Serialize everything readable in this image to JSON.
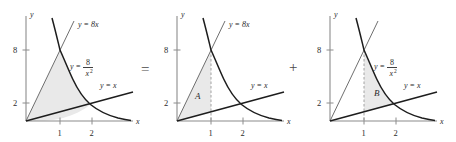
{
  "figure": {
    "caption": "",
    "operators": {
      "equals": "=",
      "plus": "+"
    },
    "shade_color": "#e9e9e9",
    "curve_color": "#1d1d1d",
    "axis_color": "#8c8c8c",
    "thin_line_color": "#6f6f6f"
  },
  "panels": [
    {
      "id": "panel-1",
      "axis": {
        "x_label": "x",
        "y_label": "y",
        "x_ticks": [
          {
            "value": 1,
            "label": "1"
          },
          {
            "value": 2,
            "label": "2"
          }
        ],
        "y_ticks": [
          {
            "value": 2,
            "label": "2"
          },
          {
            "value": 8,
            "label": "8"
          }
        ]
      },
      "curves": [
        {
          "name": "line-y-eq-8x",
          "label": "y = 8x"
        },
        {
          "name": "curve-y-eq-8-over-x-squared",
          "label_lhs": "y =",
          "label_num": "8",
          "label_den": "x",
          "label_den_exp": "2"
        },
        {
          "name": "line-y-eq-x",
          "label": "y = x"
        }
      ],
      "region_label": ""
    },
    {
      "id": "panel-2",
      "axis": {
        "x_label": "x",
        "y_label": "y",
        "x_ticks": [
          {
            "value": 1,
            "label": "1"
          },
          {
            "value": 2,
            "label": "2"
          }
        ],
        "y_ticks": [
          {
            "value": 2,
            "label": "2"
          },
          {
            "value": 8,
            "label": "8"
          }
        ]
      },
      "curves": [
        {
          "name": "line-y-eq-8x",
          "label": "y = 8x"
        },
        {
          "name": "curve-y-eq-8-over-x-squared",
          "label_lhs": "",
          "label_num": "",
          "label_den": "",
          "label_den_exp": ""
        },
        {
          "name": "line-y-eq-x",
          "label": "y = x"
        }
      ],
      "region_label": "A"
    },
    {
      "id": "panel-3",
      "axis": {
        "x_label": "x",
        "y_label": "y",
        "x_ticks": [
          {
            "value": 1,
            "label": "1"
          },
          {
            "value": 2,
            "label": "2"
          }
        ],
        "y_ticks": [
          {
            "value": 2,
            "label": "2"
          },
          {
            "value": 8,
            "label": "8"
          }
        ]
      },
      "curves": [
        {
          "name": "line-y-eq-8x",
          "label": ""
        },
        {
          "name": "curve-y-eq-8-over-x-squared",
          "label_lhs": "y =",
          "label_num": "8",
          "label_den": "x",
          "label_den_exp": "2"
        },
        {
          "name": "line-y-eq-x",
          "label": "y = x"
        }
      ],
      "region_label": "B"
    }
  ]
}
